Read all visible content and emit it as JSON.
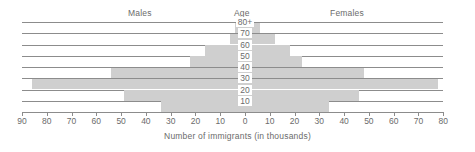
{
  "header": {
    "left_label": "Males",
    "center_label": "Age",
    "right_label": "Females"
  },
  "axis_title": "Number of immigrants (in thousands)",
  "colors": {
    "bar_fill": "#cfcfcf",
    "gridline": "#8c8c8c",
    "text": "#6b6b6b",
    "background": "#ffffff"
  },
  "chart_data": {
    "type": "bar",
    "subtype": "population-pyramid",
    "title": "",
    "xlabel": "Number of immigrants (in thousands)",
    "ylabel": "Age",
    "grid": true,
    "legend_position": "top",
    "orientation": "horizontal",
    "categories": [
      "80+",
      "70",
      "60",
      "50",
      "40",
      "30",
      "20",
      "10"
    ],
    "age_tick_labels": [
      "80+",
      "70",
      "60",
      "50",
      "40",
      "30",
      "20",
      "10"
    ],
    "xtick_labels_left": [
      "90",
      "80",
      "70",
      "60",
      "50",
      "40",
      "30",
      "20",
      "10"
    ],
    "xtick_center_label": "0",
    "xtick_labels_right": [
      "10",
      "20",
      "30",
      "40",
      "50",
      "60",
      "70",
      "80"
    ],
    "xlim_left": 90,
    "xlim_right": 80,
    "xtick_step": 10,
    "series": [
      {
        "name": "Males",
        "side": "left",
        "values": [
          4,
          6,
          16,
          22,
          54,
          86,
          49,
          34
        ]
      },
      {
        "name": "Females",
        "side": "right",
        "values": [
          6,
          12,
          18,
          23,
          48,
          78,
          46,
          34
        ]
      }
    ],
    "rows": [
      {
        "age": "80+",
        "males": 4,
        "females": 6
      },
      {
        "age": "70",
        "males": 6,
        "females": 12
      },
      {
        "age": "60",
        "males": 16,
        "females": 18
      },
      {
        "age": "50",
        "males": 22,
        "females": 23
      },
      {
        "age": "40",
        "males": 54,
        "females": 48
      },
      {
        "age": "30",
        "males": 86,
        "females": 78
      },
      {
        "age": "20",
        "males": 49,
        "females": 46
      },
      {
        "age": "10",
        "males": 34,
        "females": 34
      }
    ]
  }
}
